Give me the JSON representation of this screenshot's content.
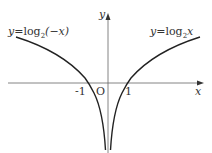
{
  "diagram": {
    "type": "function-graph",
    "axes": {
      "x_label": "x",
      "y_label": "y",
      "origin_label": "O",
      "ticks": [
        "-1",
        "1"
      ]
    },
    "curves": [
      {
        "name": "left-curve",
        "label": "y=log₂(−x)",
        "label_prefix": "y",
        "label_eq": "=log",
        "label_sub": "2",
        "label_arg": "(−x)"
      },
      {
        "name": "right-curve",
        "label": "y=log₂x",
        "label_prefix": "y",
        "label_eq": "=log",
        "label_sub": "2",
        "label_arg": "x"
      }
    ],
    "colors": {
      "curve": "#222222",
      "axis": "#555555",
      "text": "#333333"
    }
  }
}
